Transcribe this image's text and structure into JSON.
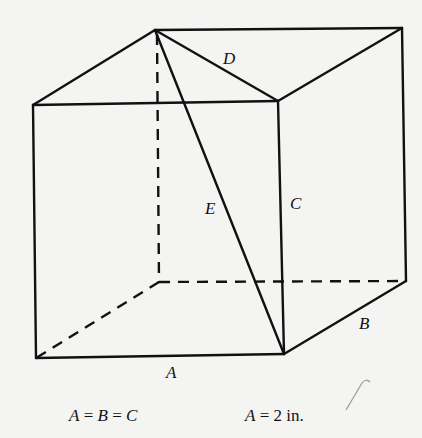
{
  "figure": {
    "vertices": {
      "front_top_left": [
        33,
        105
      ],
      "front_top_right": [
        278,
        101
      ],
      "front_bottom_left": [
        36,
        358
      ],
      "front_bottom_right": [
        284,
        354
      ],
      "back_top_left": [
        155,
        30
      ],
      "back_top_right": [
        402,
        28
      ],
      "back_bottom_left": [
        159,
        282
      ],
      "back_bottom_right": [
        406,
        281
      ]
    },
    "labels": {
      "A": "A",
      "B": "B",
      "C": "C",
      "D": "D",
      "E": "E"
    }
  },
  "captions": {
    "equality_A": "A",
    "equality_eq1": " = ",
    "equality_B": "B",
    "equality_eq2": " = ",
    "equality_C": "C",
    "length_A": "A",
    "length_rest": " = 2 in."
  }
}
